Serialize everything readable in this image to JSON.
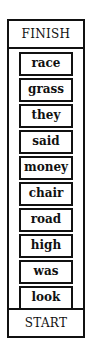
{
  "diagram": {
    "top_label": "FINISH",
    "bottom_label": "START",
    "words": [
      "race",
      "grass",
      "they",
      "said",
      "money",
      "chair",
      "road",
      "high",
      "was",
      "look"
    ]
  }
}
